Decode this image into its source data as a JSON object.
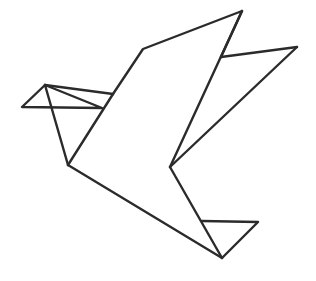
{
  "artwork": {
    "title": "Origami Bird",
    "subject": "origami-bird-line-drawing",
    "style": "line-art",
    "alt_text": "Minimal black line drawing of a folded paper origami bird in flight",
    "canvas": {
      "width": 316,
      "height": 281,
      "background_color": "#ffffff"
    },
    "stroke": {
      "color": "#2b2b2b",
      "width": 2.4,
      "linecap": "round",
      "linejoin": "round",
      "fill": "none"
    },
    "parts": [
      {
        "name": "beak",
        "label": "Beak",
        "points": "45,85 22,107 102,108 45,85"
      },
      {
        "name": "head-top-fold",
        "label": "Head top fold",
        "points": "45,85 113,94"
      },
      {
        "name": "head-underside",
        "label": "Head underside crease",
        "points": "45,85 68,165"
      },
      {
        "name": "breast-fold",
        "label": "Breast fold",
        "points": "113,94 68,165"
      },
      {
        "name": "back-and-upper-wing",
        "label": "Back and upper wing edge",
        "points": "113,94 143,49 242,11"
      },
      {
        "name": "wing-leading-edge",
        "label": "Wing leading edge",
        "points": "242,11 221,57"
      },
      {
        "name": "upper-wing-tip-spar",
        "label": "Upper wing tip spar",
        "points": "221,57 297,47"
      },
      {
        "name": "wing-inner-edge",
        "label": "Wing inner edge",
        "points": "242,11 170,167"
      },
      {
        "name": "wing-lower-edge",
        "label": "Wing lower edge",
        "points": "297,47 170,167"
      },
      {
        "name": "tail-upper-edge",
        "label": "Tail upper edge",
        "points": "170,167 222,258"
      },
      {
        "name": "body-lower-edge",
        "label": "Body lower edge",
        "points": "68,165 222,258"
      },
      {
        "name": "tail-fin",
        "label": "Tail fin triangle",
        "points": "202,221 258,222 222,258"
      }
    ]
  }
}
